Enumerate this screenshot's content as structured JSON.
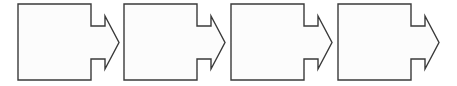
{
  "diagram": {
    "type": "process-flow",
    "title": "",
    "orientation": "horizontal",
    "canvas": {
      "width": 457,
      "height": 86,
      "background": "#ffffff"
    },
    "style": {
      "stroke_color": "#3a3a3a",
      "fill_color": "#fcfcfc",
      "stroke_width": 1.4
    },
    "shape_geometry": {
      "kind": "block-arrow",
      "box_width": 73,
      "box_height": 76,
      "box_top": 4,
      "box_bottom": 80,
      "stem_extension": 14,
      "stem_top": 26,
      "stem_bottom": 59,
      "barb_top": 16,
      "barb_bottom": 69,
      "tip_x_offset": 28,
      "tip_y": 42.5,
      "pitch": 106.7
    },
    "steps": [
      {
        "index": 1,
        "label": "",
        "x": 18,
        "y": 4
      },
      {
        "index": 2,
        "label": "",
        "x": 124,
        "y": 4
      },
      {
        "index": 3,
        "label": "",
        "x": 231,
        "y": 4
      },
      {
        "index": 4,
        "label": "",
        "x": 338,
        "y": 4
      }
    ],
    "step_count": 4
  }
}
